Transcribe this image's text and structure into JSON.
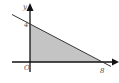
{
  "diagram": {
    "axes": {
      "x_label": "x",
      "y_label": "y",
      "origin_label": "O"
    },
    "intercepts": {
      "y_intercept_label": "4",
      "x_intercept_label": "8"
    },
    "region": {
      "description": "shaded triangle bounded by axes and line",
      "fill": "#c4c4c4"
    },
    "line_color": "#333333",
    "axis_color": "#111111"
  }
}
